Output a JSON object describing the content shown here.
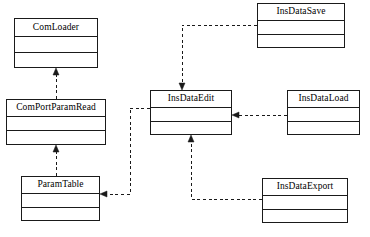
{
  "diagram": {
    "type": "uml-class-diagram",
    "width": 370,
    "height": 237,
    "background_color": "#ffffff",
    "line_color": "#1a1a1a",
    "text_color": "#000000",
    "edge_style": "dashed",
    "arrowhead_style": "filled-solid-triangle",
    "classes": [
      {
        "id": "com-loader",
        "name": "ComLoader",
        "x": 14,
        "y": 18,
        "width": 84,
        "height": 50,
        "name_compartment_height": 18,
        "attributes": "",
        "operations": ""
      },
      {
        "id": "com-port-param-read",
        "name": "ComPortParamRead",
        "x": 6,
        "y": 99,
        "width": 100,
        "height": 46,
        "name_compartment_height": 17,
        "attributes": "",
        "operations": ""
      },
      {
        "id": "param-table",
        "name": "ParamTable",
        "x": 21,
        "y": 176,
        "width": 79,
        "height": 45,
        "name_compartment_height": 17,
        "attributes": "",
        "operations": ""
      },
      {
        "id": "ins-data-edit",
        "name": "InsDataEdit",
        "x": 150,
        "y": 90,
        "width": 82,
        "height": 45,
        "name_compartment_height": 17,
        "attributes": "",
        "operations": ""
      },
      {
        "id": "ins-data-save",
        "name": "InsDataSave",
        "x": 257,
        "y": 3,
        "width": 88,
        "height": 45,
        "name_compartment_height": 17,
        "attributes": "",
        "operations": ""
      },
      {
        "id": "ins-data-load",
        "name": "InsDataLoad",
        "x": 287,
        "y": 90,
        "width": 73,
        "height": 45,
        "name_compartment_height": 17,
        "attributes": "",
        "operations": ""
      },
      {
        "id": "ins-data-export",
        "name": "InsDataExport",
        "x": 262,
        "y": 178,
        "width": 86,
        "height": 45,
        "name_compartment_height": 17,
        "attributes": "",
        "operations": ""
      }
    ],
    "edges": [
      {
        "id": "edge-comportparamread-to-comloader",
        "from": "com-port-param-read",
        "to": "com-loader",
        "label": "",
        "points": "56,99 56,71",
        "arrow_at": "56,68",
        "arrow_dir": "up"
      },
      {
        "id": "edge-paramtable-to-comportparamread",
        "from": "param-table",
        "to": "com-port-param-read",
        "label": "",
        "points": "56,176 56,148",
        "arrow_at": "56,145",
        "arrow_dir": "up"
      },
      {
        "id": "edge-insdatasave-to-insdataedit",
        "from": "ins-data-save",
        "to": "ins-data-edit",
        "label": "",
        "points": "257,25 182,25 182,87",
        "arrow_at": "182,90",
        "arrow_dir": "down"
      },
      {
        "id": "edge-insdataload-to-insdataedit",
        "from": "ins-data-load",
        "to": "ins-data-edit",
        "label": "",
        "points": "287,115 235,115",
        "arrow_at": "232,115",
        "arrow_dir": "left"
      },
      {
        "id": "edge-insdataexport-to-insdataedit",
        "from": "ins-data-export",
        "to": "ins-data-edit",
        "label": "",
        "points": "262,199 191,199 191,138",
        "arrow_at": "191,135",
        "arrow_dir": "up"
      },
      {
        "id": "edge-insdataedit-to-paramtable",
        "from": "ins-data-edit",
        "to": "param-table",
        "label": "",
        "points": "150,108 130,108 130,194 103,194",
        "arrow_at": "100,194",
        "arrow_dir": "left"
      }
    ]
  }
}
